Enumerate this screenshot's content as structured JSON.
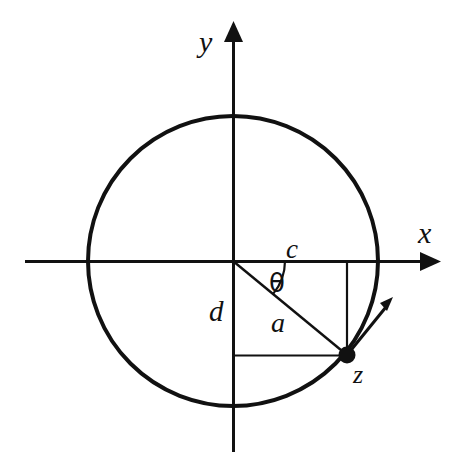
{
  "figure": {
    "background_color": "#ffffff",
    "stroke_color": "#111111",
    "labels": {
      "y_axis": "y",
      "x_axis": "x",
      "adjacent": "c",
      "opposite": "d",
      "radius": "a",
      "angle": "θ",
      "point": "z"
    },
    "icons": {
      "y_axis_arrow": "arrow-up-icon",
      "x_axis_arrow": "arrow-right-icon",
      "tangent_arrow": "arrow-diagonal-icon",
      "point_marker": "filled-dot-icon",
      "angle_arc": "arc-icon"
    }
  },
  "chart_data": {
    "type": "scatter",
    "xlabel": "x",
    "ylabel": "y",
    "grid": false,
    "legend": null,
    "geometry": {
      "circle": {
        "center": [
          0,
          0
        ],
        "radius": 1.0,
        "center_px": [
          233,
          261
        ],
        "radius_px": 145
      },
      "point_z": {
        "label": "z",
        "angle_deg": -40,
        "coordinates_px": [
          347,
          355
        ],
        "real_part_label": "c",
        "imaginary_part_label": "d",
        "modulus_label": "a"
      },
      "segments": [
        {
          "name": "radius-a",
          "from_px": [
            233,
            261
          ],
          "to_px": [
            347,
            355
          ],
          "label": "a"
        },
        {
          "name": "adjacent-c",
          "from_px": [
            233,
            261
          ],
          "to_px": [
            347,
            261
          ],
          "label": "c"
        },
        {
          "name": "opposite-d",
          "from_px": [
            233,
            261
          ],
          "to_px": [
            233,
            355
          ],
          "label": "d"
        },
        {
          "name": "projection-vertical",
          "from_px": [
            347,
            261
          ],
          "to_px": [
            347,
            355
          ],
          "label": ""
        },
        {
          "name": "projection-horizontal",
          "from_px": [
            233,
            355
          ],
          "to_px": [
            347,
            355
          ],
          "label": ""
        }
      ],
      "angle": {
        "label": "θ",
        "vertex_px": [
          233,
          261
        ],
        "from_deg": 0,
        "to_deg": -40
      },
      "tangent_vector": {
        "from_px": [
          347,
          355
        ],
        "to_px": [
          392,
          300
        ]
      },
      "axes": {
        "x": {
          "from_px": [
            25,
            261
          ],
          "to_px": [
            441,
            261
          ],
          "arrow": "end"
        },
        "y": {
          "from_px": [
            233,
            452
          ],
          "to_px": [
            233,
            21
          ],
          "arrow": "end"
        }
      }
    }
  }
}
